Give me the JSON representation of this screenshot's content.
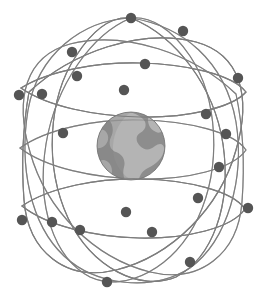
{
  "illustration": {
    "title": "Satellite constellation orbiting Earth",
    "background_color": "#ffffff",
    "width": 265,
    "height": 300
  },
  "globe": {
    "name": "earth-globe",
    "center": {
      "x": 131,
      "y": 146
    },
    "radius": 34,
    "ocean_color": "#8d8d8d",
    "land_color": "#b4b4b4",
    "shade_color": "#7a7a7a",
    "rim_color": "#6f6f6f"
  },
  "orbits": {
    "color": "#7d7d7d",
    "stroke_width": 1.15,
    "count": 8,
    "paths": [
      {
        "name": "orbit-equatorial-upper",
        "d": "M 21 88 C 50 70, 100 62, 140 63 C 185 64, 232 74, 246 92 C 232 108, 186 118, 140 117 C 96 116, 48 107, 21 88 Z"
      },
      {
        "name": "orbit-equatorial-mid",
        "d": "M 20 148 C 48 128, 98 119, 140 120 C 188 121, 234 132, 246 150 C 233 169, 187 180, 139 179 C 94 178, 46 168, 20 148 Z"
      },
      {
        "name": "orbit-equatorial-lower",
        "d": "M 22 206 C 50 187, 99 178, 141 179 C 188 180, 233 191, 245 209 C 232 228, 187 239, 139 238 C 95 237, 47 226, 22 206 Z"
      },
      {
        "name": "orbit-polar-vertical-a",
        "d": "M 131 18 C 182 26, 225 60, 236 122 C 245 178, 228 240, 190 268 C 152 292, 96 286, 64 256 C 30 224, 19 166, 28 110 C 38 54, 82 20, 131 18 Z"
      },
      {
        "name": "orbit-polar-inclined-b",
        "d": "M 131 18 C 176 36, 214 86, 223 144 C 232 206, 212 258, 176 277 C 140 292, 92 268, 68 218 C 44 166, 48 98, 76 56 C 94 28, 112 16, 131 18 Z"
      },
      {
        "name": "orbit-polar-inclined-c",
        "d": "M 131 18 C 92 34, 56 84, 46 144 C 36 206, 54 258, 90 277 C 126 293, 174 268, 198 218 C 222 166, 218 98, 190 56 C 171 28, 150 16, 131 18 Z"
      },
      {
        "name": "orbit-diagonal-d",
        "d": "M 29 92 C 72 52, 140 28, 196 42 C 240 54, 252 96, 236 150 C 220 208, 172 256, 116 270 C 66 282, 28 252, 24 200 C 21 160, 24 120, 29 92 Z"
      },
      {
        "name": "orbit-diagonal-e",
        "d": "M 236 94 C 194 54, 126 30, 70 44 C 26 56, 14 98, 30 152 C 46 210, 94 258, 150 272 C 200 284, 238 254, 242 202 C 245 162, 242 122, 236 94 Z"
      }
    ]
  },
  "satellites": {
    "name": "satellite-nodes",
    "color": "#555555",
    "radius": 5.2,
    "count": 22,
    "nodes": [
      {
        "id": "sat-01",
        "x": 131,
        "y": 18
      },
      {
        "id": "sat-02",
        "x": 183,
        "y": 31
      },
      {
        "id": "sat-03",
        "x": 145,
        "y": 64
      },
      {
        "id": "sat-04",
        "x": 77,
        "y": 76
      },
      {
        "id": "sat-05",
        "x": 238,
        "y": 78
      },
      {
        "id": "sat-06",
        "x": 124,
        "y": 90
      },
      {
        "id": "sat-07",
        "x": 19,
        "y": 95
      },
      {
        "id": "sat-08",
        "x": 42,
        "y": 94
      },
      {
        "id": "sat-09",
        "x": 226,
        "y": 134
      },
      {
        "id": "sat-10",
        "x": 219,
        "y": 167
      },
      {
        "id": "sat-11",
        "x": 126,
        "y": 212
      },
      {
        "id": "sat-12",
        "x": 248,
        "y": 208
      },
      {
        "id": "sat-13",
        "x": 22,
        "y": 220
      },
      {
        "id": "sat-14",
        "x": 52,
        "y": 222
      },
      {
        "id": "sat-15",
        "x": 80,
        "y": 230
      },
      {
        "id": "sat-16",
        "x": 152,
        "y": 232
      },
      {
        "id": "sat-17",
        "x": 190,
        "y": 262
      },
      {
        "id": "sat-18",
        "x": 107,
        "y": 282
      },
      {
        "id": "sat-19",
        "x": 206,
        "y": 114
      },
      {
        "id": "sat-20",
        "x": 63,
        "y": 133
      },
      {
        "id": "sat-21",
        "x": 198,
        "y": 198
      },
      {
        "id": "sat-22",
        "x": 72,
        "y": 52
      }
    ]
  }
}
